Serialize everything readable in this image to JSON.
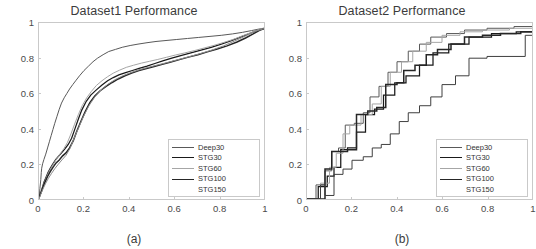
{
  "figure": {
    "background": "#ffffff",
    "panels": [
      {
        "id": "a",
        "title": "Dataset1 Performance",
        "caption": "(a)"
      },
      {
        "id": "b",
        "title": "Dataset2 Performance",
        "caption": "(b)"
      }
    ]
  },
  "legend": {
    "entries": [
      {
        "label": "Deep30",
        "color": "#595959",
        "width": 1.1
      },
      {
        "label": "STG30",
        "color": "#1a1a1a",
        "width": 1.5
      },
      {
        "label": "STG60",
        "color": "#a6a6a6",
        "width": 1.0
      },
      {
        "label": "STG100",
        "color": "#262626",
        "width": 1.7
      },
      {
        "label": "STG150",
        "color": "#ffffff",
        "width": 0
      }
    ]
  },
  "axes": {
    "xlim": [
      0,
      1
    ],
    "ylim": [
      0,
      1
    ],
    "xticks": [
      0,
      0.2,
      0.4,
      0.6,
      0.8,
      1
    ],
    "ytickis": [
      0,
      0.2,
      0.4,
      0.6,
      0.8,
      1
    ],
    "xtick_labels": [
      "0",
      "0.2",
      "0.4",
      "0.6",
      "0.8",
      "1"
    ],
    "ytick_labels": [
      "0",
      "0.2",
      "0.4",
      "0.6",
      "0.8",
      "1"
    ],
    "grid": false,
    "box": true,
    "axis_color": "#c9c9c9",
    "tick_label_color": "#4a4a4a"
  },
  "chart_data": [
    {
      "type": "line",
      "title": "Dataset1 Performance",
      "caption": "(a)",
      "xlabel": "",
      "ylabel": "",
      "xlim": [
        0,
        1
      ],
      "ylim": [
        0,
        1
      ],
      "xticks": [
        0,
        0.2,
        0.4,
        0.6,
        0.8,
        1
      ],
      "yticks": [
        0,
        0.2,
        0.4,
        0.6,
        0.8,
        1
      ],
      "grid": false,
      "legend_position": "lower-right",
      "series": [
        {
          "name": "Deep30",
          "color": "#595959",
          "x": [
            0.0,
            0.004,
            0.008,
            0.01,
            0.012,
            0.016,
            0.022,
            0.03,
            0.038,
            0.046,
            0.054,
            0.062,
            0.07,
            0.08,
            0.09,
            0.1,
            0.112,
            0.124,
            0.136,
            0.15,
            0.165,
            0.18,
            0.2,
            0.22,
            0.24,
            0.26,
            0.285,
            0.31,
            0.34,
            0.37,
            0.405,
            0.44,
            0.48,
            0.52,
            0.56,
            0.61,
            0.66,
            0.71,
            0.76,
            0.81,
            0.86,
            0.905,
            0.945,
            0.975,
            1.0
          ],
          "y": [
            0.0,
            0.06,
            0.11,
            0.15,
            0.175,
            0.2,
            0.225,
            0.255,
            0.29,
            0.325,
            0.36,
            0.395,
            0.43,
            0.47,
            0.51,
            0.545,
            0.575,
            0.6,
            0.625,
            0.65,
            0.675,
            0.7,
            0.73,
            0.755,
            0.78,
            0.8,
            0.82,
            0.838,
            0.85,
            0.862,
            0.872,
            0.88,
            0.888,
            0.895,
            0.9,
            0.906,
            0.912,
            0.918,
            0.924,
            0.93,
            0.938,
            0.947,
            0.957,
            0.965,
            0.97
          ]
        },
        {
          "name": "STG30",
          "color": "#1a1a1a",
          "x": [
            0.0,
            0.008,
            0.015,
            0.022,
            0.03,
            0.04,
            0.05,
            0.062,
            0.075,
            0.088,
            0.1,
            0.115,
            0.13,
            0.145,
            0.16,
            0.175,
            0.19,
            0.21,
            0.23,
            0.255,
            0.28,
            0.305,
            0.33,
            0.355,
            0.385,
            0.415,
            0.445,
            0.48,
            0.515,
            0.55,
            0.59,
            0.63,
            0.675,
            0.72,
            0.765,
            0.81,
            0.855,
            0.895,
            0.935,
            0.97,
            1.0
          ],
          "y": [
            0.005,
            0.035,
            0.065,
            0.095,
            0.12,
            0.15,
            0.175,
            0.2,
            0.225,
            0.245,
            0.262,
            0.285,
            0.31,
            0.345,
            0.4,
            0.455,
            0.505,
            0.555,
            0.59,
            0.62,
            0.648,
            0.672,
            0.69,
            0.705,
            0.718,
            0.73,
            0.742,
            0.755,
            0.77,
            0.785,
            0.8,
            0.815,
            0.83,
            0.846,
            0.862,
            0.88,
            0.9,
            0.92,
            0.94,
            0.958,
            0.968
          ]
        },
        {
          "name": "STG60",
          "color": "#a6a6a6",
          "x": [
            0.0,
            0.006,
            0.014,
            0.022,
            0.032,
            0.042,
            0.055,
            0.068,
            0.082,
            0.096,
            0.11,
            0.126,
            0.142,
            0.158,
            0.175,
            0.192,
            0.212,
            0.232,
            0.255,
            0.28,
            0.305,
            0.33,
            0.358,
            0.388,
            0.42,
            0.455,
            0.49,
            0.528,
            0.566,
            0.606,
            0.648,
            0.69,
            0.734,
            0.778,
            0.822,
            0.866,
            0.906,
            0.944,
            0.974,
            1.0
          ],
          "y": [
            0.0,
            0.03,
            0.06,
            0.09,
            0.12,
            0.15,
            0.18,
            0.208,
            0.235,
            0.26,
            0.285,
            0.32,
            0.37,
            0.425,
            0.48,
            0.53,
            0.575,
            0.61,
            0.645,
            0.672,
            0.695,
            0.715,
            0.732,
            0.748,
            0.76,
            0.772,
            0.782,
            0.793,
            0.805,
            0.818,
            0.83,
            0.843,
            0.858,
            0.873,
            0.89,
            0.908,
            0.928,
            0.946,
            0.962,
            0.972
          ]
        },
        {
          "name": "STG100",
          "color": "#262626",
          "x": [
            0.0,
            0.01,
            0.018,
            0.028,
            0.038,
            0.05,
            0.062,
            0.076,
            0.09,
            0.105,
            0.12,
            0.136,
            0.152,
            0.168,
            0.186,
            0.205,
            0.226,
            0.248,
            0.272,
            0.298,
            0.325,
            0.352,
            0.382,
            0.412,
            0.444,
            0.478,
            0.512,
            0.548,
            0.586,
            0.624,
            0.664,
            0.706,
            0.748,
            0.792,
            0.836,
            0.88,
            0.918,
            0.952,
            0.98,
            1.0
          ],
          "y": [
            0.01,
            0.04,
            0.07,
            0.1,
            0.128,
            0.155,
            0.18,
            0.205,
            0.222,
            0.245,
            0.262,
            0.29,
            0.33,
            0.385,
            0.44,
            0.495,
            0.548,
            0.585,
            0.615,
            0.64,
            0.662,
            0.682,
            0.7,
            0.716,
            0.73,
            0.742,
            0.753,
            0.765,
            0.778,
            0.792,
            0.806,
            0.82,
            0.836,
            0.852,
            0.87,
            0.892,
            0.915,
            0.938,
            0.958,
            0.968
          ]
        },
        {
          "name": "STG150",
          "color": "#8c8c8c",
          "x": [
            0.0,
            0.008,
            0.018,
            0.03,
            0.042,
            0.056,
            0.07,
            0.086,
            0.102,
            0.12,
            0.138,
            0.156,
            0.176,
            0.198,
            0.222,
            0.248,
            0.276,
            0.306,
            0.338,
            0.372,
            0.408,
            0.446,
            0.486,
            0.528,
            0.572,
            0.618,
            0.666,
            0.716,
            0.768,
            0.82,
            0.87,
            0.916,
            0.958,
            1.0
          ],
          "y": [
            0.0,
            0.028,
            0.058,
            0.09,
            0.118,
            0.146,
            0.172,
            0.198,
            0.222,
            0.248,
            0.288,
            0.345,
            0.405,
            0.47,
            0.53,
            0.58,
            0.62,
            0.652,
            0.678,
            0.7,
            0.718,
            0.734,
            0.748,
            0.762,
            0.776,
            0.792,
            0.808,
            0.826,
            0.846,
            0.87,
            0.898,
            0.925,
            0.952,
            0.968
          ]
        }
      ]
    },
    {
      "type": "line",
      "title": "Dataset2 Performance",
      "caption": "(b)",
      "xlabel": "",
      "ylabel": "",
      "xlim": [
        0,
        1
      ],
      "ylim": [
        0,
        1
      ],
      "xticks": [
        0,
        0.2,
        0.4,
        0.6,
        0.8,
        1
      ],
      "yticks": [
        0,
        0.2,
        0.4,
        0.6,
        0.8,
        1
      ],
      "grid": false,
      "legend_position": "lower-right",
      "note": "step-style ROC curves (staircase)",
      "series": [
        {
          "name": "Deep30",
          "color": "#595959",
          "step": true,
          "x": [
            0.0,
            0.04,
            0.04,
            0.08,
            0.08,
            0.11,
            0.11,
            0.14,
            0.14,
            0.17,
            0.17,
            0.21,
            0.21,
            0.25,
            0.25,
            0.28,
            0.28,
            0.32,
            0.32,
            0.36,
            0.36,
            0.4,
            0.4,
            0.45,
            0.45,
            0.5,
            0.5,
            0.55,
            0.55,
            0.62,
            0.62,
            0.7,
            0.7,
            0.8,
            0.8,
            0.92,
            0.92,
            1.0
          ],
          "y": [
            0.0,
            0.0,
            0.08,
            0.08,
            0.16,
            0.16,
            0.27,
            0.27,
            0.29,
            0.29,
            0.42,
            0.42,
            0.43,
            0.43,
            0.49,
            0.49,
            0.58,
            0.58,
            0.64,
            0.64,
            0.72,
            0.72,
            0.78,
            0.78,
            0.84,
            0.84,
            0.88,
            0.88,
            0.92,
            0.92,
            0.94,
            0.94,
            0.96,
            0.96,
            0.97,
            0.97,
            0.98,
            0.98
          ]
        },
        {
          "name": "STG30",
          "color": "#1a1a1a",
          "step": true,
          "x": [
            0.0,
            0.05,
            0.05,
            0.09,
            0.09,
            0.12,
            0.12,
            0.15,
            0.15,
            0.18,
            0.18,
            0.22,
            0.22,
            0.26,
            0.26,
            0.3,
            0.3,
            0.34,
            0.34,
            0.39,
            0.39,
            0.44,
            0.44,
            0.5,
            0.5,
            0.56,
            0.56,
            0.63,
            0.63,
            0.72,
            0.72,
            0.82,
            0.82,
            0.93,
            0.93,
            1.0
          ],
          "y": [
            0.0,
            0.0,
            0.07,
            0.07,
            0.13,
            0.13,
            0.18,
            0.18,
            0.28,
            0.28,
            0.29,
            0.29,
            0.38,
            0.38,
            0.48,
            0.48,
            0.51,
            0.51,
            0.59,
            0.59,
            0.66,
            0.66,
            0.7,
            0.7,
            0.76,
            0.76,
            0.83,
            0.83,
            0.88,
            0.88,
            0.92,
            0.92,
            0.94,
            0.94,
            0.95,
            0.95
          ]
        },
        {
          "name": "STG60",
          "color": "#a6a6a6",
          "step": true,
          "x": [
            0.0,
            0.06,
            0.06,
            0.1,
            0.1,
            0.13,
            0.13,
            0.16,
            0.16,
            0.19,
            0.19,
            0.24,
            0.24,
            0.29,
            0.29,
            0.33,
            0.33,
            0.37,
            0.37,
            0.42,
            0.42,
            0.47,
            0.47,
            0.53,
            0.53,
            0.6,
            0.6,
            0.68,
            0.68,
            0.78,
            0.78,
            0.9,
            0.9,
            1.0
          ],
          "y": [
            0.0,
            0.0,
            0.09,
            0.09,
            0.18,
            0.18,
            0.26,
            0.26,
            0.37,
            0.37,
            0.42,
            0.42,
            0.48,
            0.48,
            0.54,
            0.54,
            0.64,
            0.64,
            0.72,
            0.72,
            0.78,
            0.78,
            0.84,
            0.84,
            0.89,
            0.89,
            0.93,
            0.93,
            0.95,
            0.95,
            0.96,
            0.96,
            0.97,
            0.97
          ]
        },
        {
          "name": "STG100",
          "color": "#262626",
          "step": true,
          "x": [
            0.0,
            0.08,
            0.08,
            0.11,
            0.11,
            0.18,
            0.18,
            0.22,
            0.22,
            0.27,
            0.27,
            0.31,
            0.31,
            0.35,
            0.35,
            0.4,
            0.4,
            0.43,
            0.43,
            0.48,
            0.48,
            0.53,
            0.53,
            0.58,
            0.58,
            0.64,
            0.64,
            0.7,
            0.7,
            0.78,
            0.78,
            0.86,
            0.86,
            0.95,
            0.95,
            1.0
          ],
          "y": [
            0.0,
            0.0,
            0.17,
            0.17,
            0.27,
            0.27,
            0.28,
            0.28,
            0.48,
            0.48,
            0.5,
            0.5,
            0.52,
            0.52,
            0.65,
            0.65,
            0.66,
            0.66,
            0.73,
            0.73,
            0.76,
            0.76,
            0.82,
            0.82,
            0.85,
            0.85,
            0.88,
            0.88,
            0.92,
            0.92,
            0.93,
            0.93,
            0.94,
            0.94,
            0.95,
            0.95
          ]
        },
        {
          "name": "STG150",
          "color": "#3f3f3f",
          "step": true,
          "x": [
            0.0,
            0.06,
            0.06,
            0.08,
            0.08,
            0.12,
            0.12,
            0.16,
            0.16,
            0.2,
            0.2,
            0.25,
            0.25,
            0.29,
            0.29,
            0.33,
            0.33,
            0.37,
            0.37,
            0.41,
            0.41,
            0.45,
            0.45,
            0.5,
            0.5,
            0.55,
            0.55,
            0.6,
            0.6,
            0.66,
            0.66,
            0.72,
            0.72,
            0.8,
            0.8,
            0.97,
            0.97,
            1.0
          ],
          "y": [
            0.0,
            0.0,
            0.08,
            0.08,
            0.02,
            0.02,
            0.14,
            0.14,
            0.17,
            0.17,
            0.22,
            0.22,
            0.24,
            0.24,
            0.29,
            0.29,
            0.31,
            0.31,
            0.37,
            0.37,
            0.44,
            0.44,
            0.49,
            0.49,
            0.53,
            0.53,
            0.58,
            0.58,
            0.65,
            0.65,
            0.7,
            0.7,
            0.8,
            0.8,
            0.81,
            0.81,
            0.93,
            0.93
          ]
        }
      ]
    }
  ]
}
